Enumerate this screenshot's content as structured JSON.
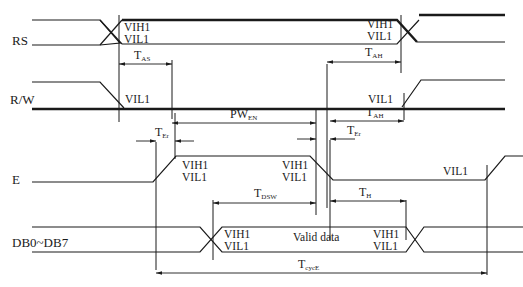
{
  "signals": [
    {
      "name": "RS"
    },
    {
      "name": "R/W"
    },
    {
      "name": "E"
    },
    {
      "name": "DB0~DB7"
    }
  ],
  "levels": {
    "vih": "VIH1",
    "vil": "VIL1"
  },
  "data_label": "Valid data",
  "timings": {
    "tas": {
      "main": "T",
      "sub": "AS"
    },
    "tah1": {
      "main": "T",
      "sub": "AH"
    },
    "tah2": {
      "main": "T",
      "sub": "AH"
    },
    "pwen": {
      "main": "PW",
      "sub": "EN"
    },
    "ter1": {
      "main": "T",
      "sub": "Er"
    },
    "ter2": {
      "main": "T",
      "sub": "Er"
    },
    "tdsw": {
      "main": "T",
      "sub": "DSW"
    },
    "th": {
      "main": "T",
      "sub": "H"
    },
    "tcyce": {
      "main": "T",
      "sub": "cycE"
    }
  }
}
